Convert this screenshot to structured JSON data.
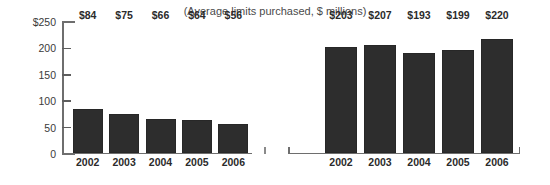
{
  "chart_data": {
    "type": "bar",
    "title": "",
    "subtitle": "(Average limits purchased, $ millions)",
    "xlabel": "",
    "ylabel": "",
    "ylim": [
      0,
      250
    ],
    "grid": false,
    "legend": "none",
    "categories": [
      "2002",
      "2003",
      "2004",
      "2005",
      "2006"
    ],
    "y_ticks": [
      "$250",
      "200",
      "150",
      "100",
      "50",
      "0"
    ],
    "y_tick_values": [
      250,
      200,
      150,
      100,
      50,
      0
    ],
    "panels": [
      {
        "name": "left-panel",
        "categories": [
          "2002",
          "2003",
          "2004",
          "2005",
          "2006"
        ],
        "values": [
          84,
          75,
          66,
          64,
          56
        ],
        "value_labels": [
          "$84",
          "$75",
          "$66",
          "$64",
          "$56"
        ]
      },
      {
        "name": "right-panel",
        "categories": [
          "2002",
          "2003",
          "2004",
          "2005",
          "2006"
        ],
        "values": [
          203,
          207,
          193,
          199,
          220
        ],
        "value_labels": [
          "$203",
          "$207",
          "$193",
          "$199",
          "$220"
        ]
      }
    ],
    "colors": {
      "bar": "#2d2d2d",
      "axis": "#6e6e6e",
      "text": "#2b2b2b",
      "background": "#ffffff"
    }
  },
  "axis": {
    "ticks": [
      {
        "label": "$250",
        "value": 250
      },
      {
        "label": "200",
        "value": 200
      },
      {
        "label": "150",
        "value": 150
      },
      {
        "label": "100",
        "value": 100
      },
      {
        "label": "50",
        "value": 50
      },
      {
        "label": "0",
        "value": 0
      }
    ]
  },
  "left": {
    "bars": [
      {
        "category": "2002",
        "value": 84,
        "label": "$84"
      },
      {
        "category": "2003",
        "value": 75,
        "label": "$75"
      },
      {
        "category": "2004",
        "value": 66,
        "label": "$66"
      },
      {
        "category": "2005",
        "value": 64,
        "label": "$64"
      },
      {
        "category": "2006",
        "value": 56,
        "label": "$56"
      }
    ]
  },
  "right": {
    "bars": [
      {
        "category": "2002",
        "value": 203,
        "label": "$203"
      },
      {
        "category": "2003",
        "value": 207,
        "label": "$207"
      },
      {
        "category": "2004",
        "value": 193,
        "label": "$193"
      },
      {
        "category": "2005",
        "value": 199,
        "label": "$199"
      },
      {
        "category": "2006",
        "value": 220,
        "label": "$220"
      }
    ]
  },
  "header": {
    "title": "",
    "subtitle": "(Average limits purchased, $ millions)"
  }
}
